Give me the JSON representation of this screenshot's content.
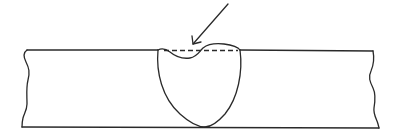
{
  "diagram": {
    "type": "weld cross-section",
    "colors": {
      "line": "#2a2a2a",
      "background": "#ffffff"
    },
    "elements": {
      "plate": "base-plate",
      "weld": "weld-nugget",
      "reference_line": "original-surface-dashed-line",
      "indicator": "defect-arrow"
    }
  }
}
